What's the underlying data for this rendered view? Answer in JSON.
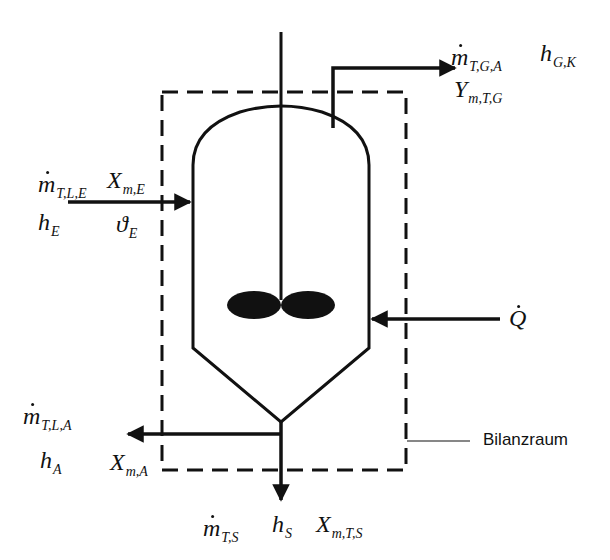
{
  "diagram": {
    "type": "process-balance-schematic",
    "balance_space_label": "Bilanzraum",
    "streams": {
      "feed": {
        "mass_flow": {
          "base": "m",
          "dot": true,
          "sub": "T,L,E"
        },
        "enthalpy": {
          "base": "h",
          "sub": "E"
        },
        "loading": {
          "base": "X",
          "sub": "m,E"
        },
        "temperature": {
          "base": "ϑ",
          "sub": "E"
        }
      },
      "gas_out": {
        "mass_flow": {
          "base": "m",
          "dot": true,
          "sub": "T,G,A"
        },
        "enthalpy": {
          "base": "h",
          "sub": "G,K"
        },
        "loading": {
          "base": "Y",
          "sub": "m,T,G"
        }
      },
      "heat": {
        "symbol": {
          "base": "Q",
          "dot": true
        }
      },
      "liquid_out": {
        "mass_flow": {
          "base": "m",
          "dot": true,
          "sub": "T,L,A"
        },
        "enthalpy": {
          "base": "h",
          "sub": "A"
        },
        "loading": {
          "base": "X",
          "sub": "m,A"
        }
      },
      "solid_out": {
        "mass_flow": {
          "base": "m",
          "dot": true,
          "sub": "T,S"
        },
        "enthalpy": {
          "base": "h",
          "sub": "S"
        },
        "loading": {
          "base": "X",
          "sub": "m,T,S"
        }
      }
    },
    "colors": {
      "stroke": "#111111",
      "background": "#ffffff"
    }
  }
}
